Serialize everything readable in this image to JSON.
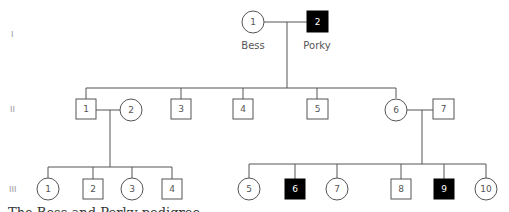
{
  "figure": {
    "generations": [
      {
        "label": "I"
      },
      {
        "label": "II"
      },
      {
        "label": "III"
      }
    ],
    "names": {
      "I_1": "Bess",
      "I_2": "Porky"
    },
    "caption": "The Bess and Porky pedigree",
    "colors": {
      "line": "#555555",
      "affected": "#000000",
      "unaffected": "#ffffff",
      "number": "#555555",
      "number_affected": "#ffffff"
    },
    "legend": {
      "circle": "female",
      "square": "male",
      "filled": "affected"
    }
  },
  "individuals": {
    "I": [
      {
        "id": "1",
        "sex": "female",
        "affected": false,
        "name": "Bess"
      },
      {
        "id": "2",
        "sex": "male",
        "affected": true,
        "name": "Porky"
      }
    ],
    "II": [
      {
        "id": "1",
        "sex": "male",
        "affected": false
      },
      {
        "id": "2",
        "sex": "female",
        "affected": false
      },
      {
        "id": "3",
        "sex": "male",
        "affected": false
      },
      {
        "id": "4",
        "sex": "male",
        "affected": false
      },
      {
        "id": "5",
        "sex": "male",
        "affected": false
      },
      {
        "id": "6",
        "sex": "female",
        "affected": false
      },
      {
        "id": "7",
        "sex": "male",
        "affected": false
      }
    ],
    "III": [
      {
        "id": "1",
        "sex": "female",
        "affected": false
      },
      {
        "id": "2",
        "sex": "male",
        "affected": false
      },
      {
        "id": "3",
        "sex": "female",
        "affected": false
      },
      {
        "id": "4",
        "sex": "male",
        "affected": false
      },
      {
        "id": "5",
        "sex": "female",
        "affected": false
      },
      {
        "id": "6",
        "sex": "male",
        "affected": true
      },
      {
        "id": "7",
        "sex": "female",
        "affected": false
      },
      {
        "id": "8",
        "sex": "male",
        "affected": false
      },
      {
        "id": "9",
        "sex": "male",
        "affected": true
      },
      {
        "id": "10",
        "sex": "female",
        "affected": false
      }
    ]
  }
}
